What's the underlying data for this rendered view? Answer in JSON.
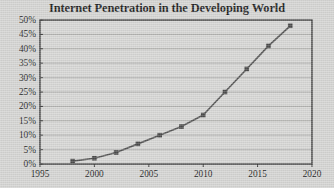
{
  "chart_data": {
    "type": "line",
    "title": "Internet Penetration in the Developing World",
    "xlabel": "",
    "ylabel": "",
    "x": [
      1998,
      2000,
      2002,
      2004,
      2006,
      2008,
      2010,
      2012,
      2014,
      2016,
      2018
    ],
    "values": [
      1,
      2,
      4,
      7,
      10,
      13,
      17,
      25,
      33,
      41,
      48
    ],
    "series": [
      {
        "name": "Internet penetration",
        "values": [
          1,
          2,
          4,
          7,
          10,
          13,
          17,
          25,
          33,
          41,
          48
        ]
      }
    ],
    "xlim": [
      1995,
      2020
    ],
    "ylim": [
      0,
      50
    ],
    "xticks": [
      1995,
      2000,
      2005,
      2010,
      2015,
      2020
    ],
    "xtick_labels": [
      "1995",
      "2000",
      "2005",
      "2010",
      "2015",
      "2020"
    ],
    "yticks": [
      0,
      5,
      10,
      15,
      20,
      25,
      30,
      35,
      40,
      45,
      50
    ],
    "ytick_labels": [
      "0%",
      "5%",
      "10%",
      "15%",
      "20%",
      "25%",
      "30%",
      "35%",
      "40%",
      "45%",
      "50%"
    ],
    "grid": "horizontal",
    "legend": "none",
    "marker": "square",
    "line_color": "#555555",
    "marker_color": "#4a4a4a",
    "plot_background": "#d6d6d4",
    "axis_color": "#3a3a3a",
    "gridline_color": "#a8a8a6",
    "title_color": "#1e1e1e"
  }
}
